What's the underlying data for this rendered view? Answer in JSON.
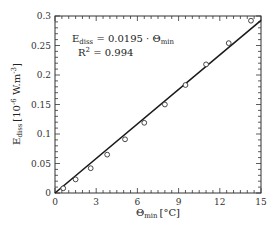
{
  "chart_data": {
    "type": "scatter",
    "title": "",
    "xlabel": "Θmin [°C]",
    "xlabel_main": "Θ",
    "xlabel_sub": "min",
    "xlabel_unit": "[°C]",
    "ylabel": "Ediss [10^-6 W.m^-3]",
    "ylabel_main": "E",
    "ylabel_sub": "diss",
    "ylabel_unit_prefix": "[10",
    "ylabel_unit_exp": "-6",
    "ylabel_unit_mid": " W.m",
    "ylabel_unit_exp2": "-3",
    "ylabel_unit_suffix": "]",
    "xlim": [
      0,
      15
    ],
    "ylim": [
      0,
      0.3
    ],
    "x_ticks": [
      0,
      3,
      6,
      9,
      12,
      15
    ],
    "x_tick_labels": [
      "0",
      "3",
      "6",
      "9",
      "12",
      "15"
    ],
    "x_minor_step": 0.5,
    "y_ticks": [
      0,
      0.05,
      0.1,
      0.15,
      0.2,
      0.25,
      0.3
    ],
    "y_tick_labels": [
      "0",
      "0.05",
      "0.1",
      "0.15",
      "0.2",
      "0.25",
      "0.3"
    ],
    "y_minor_step": 0.01,
    "grid": false,
    "legend": null,
    "series": [
      {
        "name": "measured",
        "marker": "open-circle",
        "x": [
          0.6,
          1.5,
          2.6,
          3.8,
          5.1,
          6.5,
          8.0,
          9.5,
          11.0,
          12.65,
          14.27
        ],
        "y": [
          0.008,
          0.023,
          0.042,
          0.065,
          0.091,
          0.119,
          0.15,
          0.183,
          0.218,
          0.254,
          0.292
        ]
      },
      {
        "name": "linear fit",
        "style": "solid-line",
        "slope": 0.0195,
        "x": [
          0,
          15
        ],
        "y": [
          0,
          0.2925
        ]
      }
    ],
    "annotations": [
      {
        "text": "Ediss = 0.0195 · Θmin",
        "eq_lhs_main": "E",
        "eq_lhs_sub": "diss",
        "eq_mid": " = 0.0195 · Θ",
        "eq_rhs_sub": "min"
      },
      {
        "text": "R² = 0.994",
        "r2_main": "R",
        "r2_sup": "2",
        "r2_value": " = 0.994"
      }
    ]
  },
  "colors": {
    "axis": "#333333",
    "marker": "#333333",
    "fit_line": "#1a1a1a",
    "background": "#ffffff"
  }
}
